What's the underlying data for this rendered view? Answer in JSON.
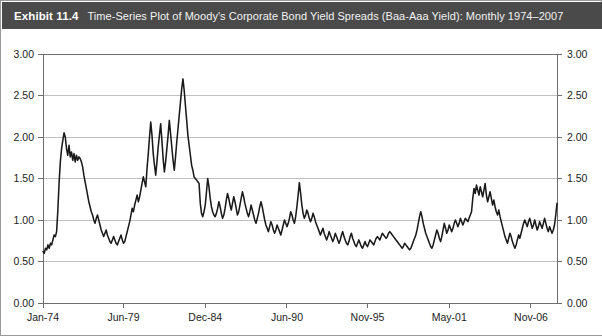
{
  "caption": {
    "label": "Exhibit 11.4",
    "text": "Time-Series Plot of Moody's Corporate Bond Yield Spreads (Baa-Aaa Yield): Monthly 1974–2007"
  },
  "chart_data": {
    "type": "line",
    "xlabel": "",
    "ylabel": "",
    "grid": true,
    "legend": null,
    "ylim": [
      0.0,
      3.0
    ],
    "ytick_values": [
      0.0,
      0.5,
      1.0,
      1.5,
      2.0,
      2.5,
      3.0
    ],
    "ytick_labels": [
      "0.00",
      "0.50",
      "1.00",
      "1.50",
      "2.00",
      "2.50",
      "3.00"
    ],
    "ytick_labels_right": [
      "0.00",
      "0.50",
      "1.00",
      "1.50",
      "2.00",
      "2.50",
      "3.00"
    ],
    "xtick_labels": [
      "Jan-74",
      "Jun-79",
      "Dec-84",
      "Jun-90",
      "Nov-95",
      "May-01",
      "Nov-06"
    ],
    "xtick_index": [
      0,
      65,
      131,
      197,
      262,
      328,
      394
    ],
    "x_start": "Jan-74",
    "x_end": "Dec-07",
    "n_points": 408,
    "units": "percentage points",
    "series": [
      {
        "name": "Baa-Aaa Yield Spread",
        "color": "#1a1a1a",
        "values": [
          0.62,
          0.6,
          0.66,
          0.64,
          0.7,
          0.66,
          0.72,
          0.7,
          0.76,
          0.82,
          0.8,
          0.86,
          1.12,
          1.45,
          1.7,
          1.86,
          1.96,
          2.05,
          2.0,
          1.86,
          1.78,
          1.9,
          1.76,
          1.82,
          1.72,
          1.8,
          1.7,
          1.78,
          1.72,
          1.76,
          1.74,
          1.7,
          1.64,
          1.54,
          1.46,
          1.38,
          1.3,
          1.22,
          1.16,
          1.1,
          1.06,
          1.0,
          0.96,
          1.02,
          1.06,
          1.0,
          0.94,
          0.88,
          0.84,
          0.8,
          0.84,
          0.88,
          0.82,
          0.78,
          0.74,
          0.72,
          0.76,
          0.8,
          0.76,
          0.72,
          0.7,
          0.74,
          0.78,
          0.82,
          0.76,
          0.72,
          0.74,
          0.8,
          0.86,
          0.92,
          0.98,
          1.06,
          1.14,
          1.1,
          1.18,
          1.24,
          1.3,
          1.22,
          1.28,
          1.36,
          1.44,
          1.52,
          1.46,
          1.4,
          1.62,
          1.8,
          2.0,
          2.18,
          2.02,
          1.8,
          1.66,
          1.54,
          1.7,
          1.88,
          2.02,
          2.16,
          1.96,
          1.74,
          1.58,
          1.7,
          1.86,
          2.02,
          2.2,
          2.04,
          1.88,
          1.72,
          1.6,
          1.76,
          1.94,
          2.1,
          2.26,
          2.42,
          2.58,
          2.7,
          2.56,
          2.38,
          2.2,
          2.02,
          1.9,
          1.78,
          1.66,
          1.6,
          1.52,
          1.5,
          1.48,
          1.46,
          1.44,
          1.2,
          1.08,
          1.04,
          1.1,
          1.18,
          1.34,
          1.5,
          1.4,
          1.26,
          1.16,
          1.1,
          1.06,
          1.04,
          1.08,
          1.14,
          1.22,
          1.16,
          1.08,
          1.02,
          1.06,
          1.14,
          1.24,
          1.32,
          1.26,
          1.18,
          1.12,
          1.2,
          1.28,
          1.22,
          1.14,
          1.06,
          1.1,
          1.18,
          1.26,
          1.34,
          1.28,
          1.2,
          1.14,
          1.08,
          1.04,
          1.1,
          1.18,
          1.12,
          1.06,
          1.0,
          0.96,
          1.02,
          1.08,
          1.16,
          1.22,
          1.16,
          1.08,
          1.0,
          0.94,
          0.9,
          0.86,
          0.92,
          0.98,
          0.94,
          0.88,
          0.84,
          0.88,
          0.94,
          0.9,
          0.86,
          0.82,
          0.88,
          0.94,
          1.0,
          0.96,
          0.92,
          0.96,
          1.02,
          1.1,
          1.06,
          1.0,
          0.96,
          1.04,
          1.16,
          1.3,
          1.45,
          1.32,
          1.18,
          1.08,
          1.02,
          1.06,
          1.12,
          1.08,
          1.02,
          0.98,
          1.02,
          1.08,
          1.04,
          0.98,
          0.94,
          0.9,
          0.86,
          0.82,
          0.86,
          0.9,
          0.84,
          0.8,
          0.76,
          0.8,
          0.86,
          0.82,
          0.78,
          0.74,
          0.78,
          0.84,
          0.8,
          0.76,
          0.72,
          0.76,
          0.82,
          0.86,
          0.8,
          0.76,
          0.72,
          0.7,
          0.74,
          0.8,
          0.84,
          0.78,
          0.74,
          0.7,
          0.68,
          0.72,
          0.76,
          0.72,
          0.68,
          0.66,
          0.7,
          0.74,
          0.7,
          0.68,
          0.72,
          0.76,
          0.74,
          0.72,
          0.7,
          0.74,
          0.78,
          0.8,
          0.78,
          0.76,
          0.8,
          0.84,
          0.82,
          0.8,
          0.78,
          0.8,
          0.84,
          0.86,
          0.84,
          0.82,
          0.8,
          0.78,
          0.76,
          0.74,
          0.72,
          0.7,
          0.68,
          0.66,
          0.68,
          0.72,
          0.7,
          0.68,
          0.66,
          0.64,
          0.66,
          0.7,
          0.74,
          0.78,
          0.82,
          0.88,
          0.96,
          1.04,
          1.1,
          1.04,
          0.96,
          0.9,
          0.84,
          0.8,
          0.76,
          0.72,
          0.68,
          0.66,
          0.7,
          0.76,
          0.82,
          0.88,
          0.84,
          0.78,
          0.74,
          0.8,
          0.88,
          0.96,
          0.9,
          0.84,
          0.88,
          0.94,
          0.9,
          0.86,
          0.9,
          0.96,
          1.0,
          0.96,
          0.92,
          0.96,
          1.02,
          0.98,
          0.94,
          0.98,
          1.02,
          1.0,
          0.98,
          1.02,
          1.06,
          1.1,
          1.26,
          1.38,
          1.32,
          1.42,
          1.36,
          1.3,
          1.4,
          1.34,
          1.28,
          1.36,
          1.44,
          1.3,
          1.22,
          1.28,
          1.34,
          1.26,
          1.18,
          1.24,
          1.16,
          1.1,
          1.06,
          1.12,
          1.04,
          0.98,
          0.92,
          0.86,
          0.8,
          0.76,
          0.72,
          0.78,
          0.84,
          0.8,
          0.74,
          0.7,
          0.66,
          0.7,
          0.76,
          0.82,
          0.78,
          0.84,
          0.9,
          0.96,
          1.0,
          0.96,
          0.92,
          0.98,
          1.02,
          0.96,
          0.9,
          0.94,
          1.0,
          0.94,
          0.88,
          0.92,
          0.98,
          0.94,
          0.9,
          0.96,
          1.02,
          0.96,
          0.9,
          0.86,
          0.92,
          0.88,
          0.84,
          0.88,
          0.94,
          1.06,
          1.2
        ]
      }
    ]
  }
}
